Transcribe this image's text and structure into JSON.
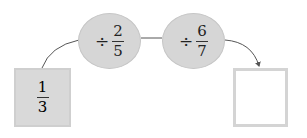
{
  "diagram": {
    "start": {
      "numerator": "1",
      "denominator": "3"
    },
    "operations": [
      {
        "sign": "÷",
        "numerator": "2",
        "denominator": "5"
      },
      {
        "sign": "÷",
        "numerator": "6",
        "denominator": "7"
      }
    ],
    "result": {
      "value": ""
    },
    "colors": {
      "node_fill": "#d6d6d6",
      "box_border": "#d4d4d4",
      "line": "#555555"
    }
  }
}
